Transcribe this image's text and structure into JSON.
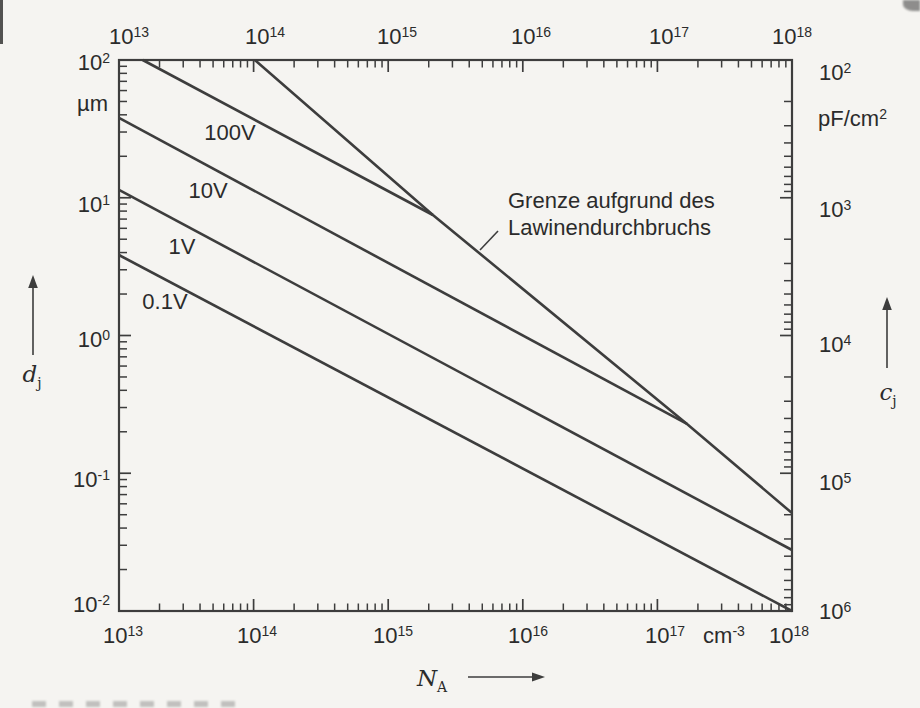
{
  "figure": {
    "background": "#f5f4f1",
    "ink_color": "#3d3d3d",
    "text_color": "#2b2b2b"
  },
  "chart_data": {
    "type": "line",
    "title": "",
    "x_axis": {
      "quantity": "N_A",
      "unit": "cm^-3",
      "scale": "log",
      "range": [
        10000000000000.0,
        1e+18
      ],
      "tick_labels": [
        "10^13",
        "10^14",
        "10^15",
        "10^16",
        "10^17",
        "10^18"
      ]
    },
    "y_axis_left": {
      "quantity": "d_j",
      "unit": "µm",
      "scale": "log",
      "range": [
        0.01,
        100
      ],
      "tick_labels": [
        "10^2",
        "10^1",
        "10^0",
        "10^-1",
        "10^-2"
      ]
    },
    "y_axis_right": {
      "quantity": "c_j",
      "unit": "pF/cm^2",
      "scale": "log",
      "direction": "inverted",
      "range": [
        100,
        1000000
      ],
      "tick_labels": [
        "10^2",
        "10^3",
        "10^4",
        "10^5",
        "10^6"
      ]
    },
    "grid": "off",
    "series": [
      {
        "name": "100V",
        "points": [
          [
            15000000000000.0,
            100
          ],
          [
            2150000000000000.0,
            7.5
          ]
        ]
      },
      {
        "name": "10V",
        "points": [
          [
            10000000000000.0,
            38
          ],
          [
            1.66e+17,
            0.228
          ]
        ]
      },
      {
        "name": "1V",
        "points": [
          [
            10000000000000.0,
            11.4
          ],
          [
            1e+18,
            0.0277
          ]
        ]
      },
      {
        "name": "0.1V",
        "points": [
          [
            10000000000000.0,
            3.84
          ],
          [
            1e+18,
            0.01
          ]
        ]
      },
      {
        "name": "Grenze aufgrund des Lawinendurchbruchs",
        "points": [
          [
            102000000000000.0,
            100
          ],
          [
            2150000000000000.0,
            7.5
          ],
          [
            1.66e+17,
            0.228
          ],
          [
            1e+18,
            0.0514
          ]
        ]
      }
    ],
    "annotation": {
      "text_line1": "Grenze aufgrund des",
      "text_line2": "Lawinendurchbruchs"
    }
  }
}
